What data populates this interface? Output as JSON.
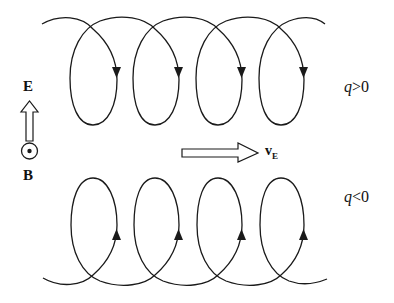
{
  "figure": {
    "labels": {
      "E": "E",
      "B": "B",
      "vE": "v",
      "vE_sub": "E",
      "q_pos_var": "q",
      "q_pos_rel": ">0",
      "q_neg_var": "q",
      "q_neg_rel": "<0"
    },
    "icons": {
      "E_arrow": "hollow-up-arrow",
      "B_symbol": "circle-dot-out-of-page",
      "drift_arrow": "hollow-right-arrow"
    },
    "trajectories": [
      {
        "charge": "q>0",
        "loops": 4,
        "arrow_direction": "down",
        "position": "top"
      },
      {
        "charge": "q<0",
        "loops": 4,
        "arrow_direction": "up",
        "position": "bottom"
      }
    ],
    "colors": {
      "stroke": "#1a1a1a",
      "background": "#ffffff"
    }
  }
}
